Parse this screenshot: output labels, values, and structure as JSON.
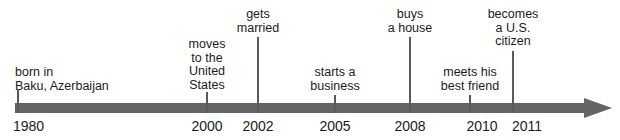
{
  "figure": {
    "type": "timeline",
    "orientation": "horizontal",
    "colors": {
      "axis": "#646464",
      "tick_line": "#5a5a5a",
      "text": "#1b1b1b",
      "background": "#ffffff"
    },
    "axis": {
      "start_year": "1980",
      "end_year": "2011",
      "has_arrowhead": true,
      "arrow_direction": "right"
    }
  },
  "chart_data": {
    "type": "timeline",
    "title": "",
    "xlabel": "",
    "ylabel": "",
    "axis_range": [
      "1980",
      "2011"
    ],
    "grid": false,
    "legend": "none",
    "events": [
      {
        "year": "1980",
        "label_lines": [
          "born in",
          "Baku, Azerbaijan"
        ],
        "label_text": "born in Baku, Azerbaijan",
        "x": 17,
        "label_top": 66,
        "tick_top": 89,
        "align": "left"
      },
      {
        "year": "2000",
        "label_lines": [
          "moves",
          "to the",
          "United",
          "States"
        ],
        "label_text": "moves to the United States",
        "x": 207,
        "label_top": 38,
        "tick_top": 92,
        "align": "center"
      },
      {
        "year": "2002",
        "label_lines": [
          "gets",
          "married"
        ],
        "label_text": "gets married",
        "x": 258,
        "label_top": 8,
        "tick_top": 37,
        "align": "center"
      },
      {
        "year": "2005",
        "label_lines": [
          "starts a",
          "business"
        ],
        "label_text": "starts a business",
        "x": 335,
        "label_top": 66,
        "tick_top": 95,
        "align": "center"
      },
      {
        "year": "2008",
        "label_lines": [
          "buys",
          "a house"
        ],
        "label_text": "buys a house",
        "x": 410,
        "label_top": 8,
        "tick_top": 37,
        "align": "center"
      },
      {
        "year": "2010",
        "label_lines": [
          "meets his",
          "best friend"
        ],
        "label_text": "meets his best friend",
        "x": 470,
        "label_top": 66,
        "tick_top": 95,
        "align": "center"
      },
      {
        "year": "2011",
        "label_lines": [
          "becomes",
          "a U.S.",
          "citizen"
        ],
        "label_text": "becomes a U.S. citizen",
        "x": 513,
        "label_top": 8,
        "tick_top": 51,
        "align": "center"
      }
    ],
    "year_labels": [
      {
        "text": "1980",
        "x": 13,
        "align": "left"
      },
      {
        "text": "2000",
        "x": 207,
        "align": "center"
      },
      {
        "text": "2002",
        "x": 258,
        "align": "center"
      },
      {
        "text": "2005",
        "x": 335,
        "align": "center"
      },
      {
        "text": "2008",
        "x": 410,
        "align": "center"
      },
      {
        "text": "2010",
        "x": 482,
        "align": "center"
      },
      {
        "text": "2011",
        "x": 527,
        "align": "center"
      }
    ]
  }
}
